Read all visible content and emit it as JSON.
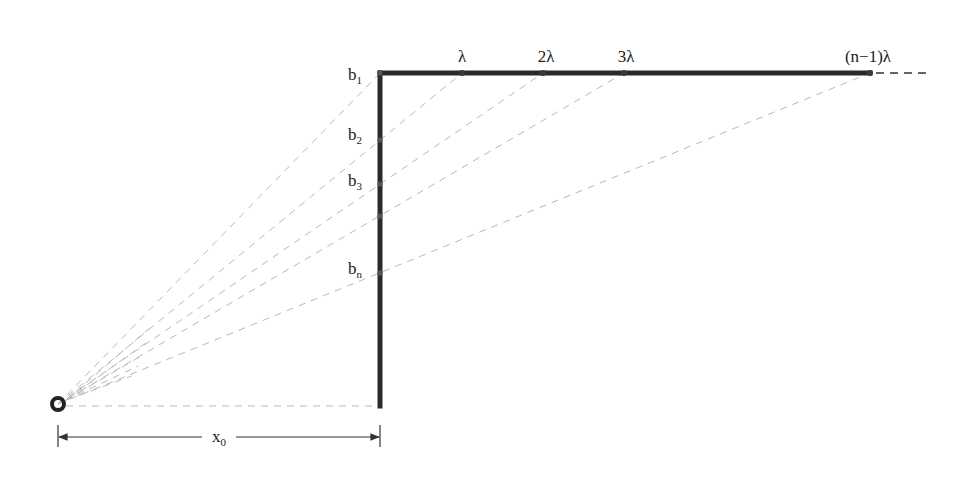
{
  "diagram": {
    "type": "geometric-construction",
    "colors": {
      "bar": "#2a2a2a",
      "ray": "#b8b8b8",
      "text": "#222222",
      "background": "#ffffff"
    },
    "source": {
      "name": "source-point",
      "x": 58,
      "y": 404,
      "r": 6
    },
    "corner": {
      "x": 380,
      "y": 73
    },
    "vertical_bar": {
      "x": 380,
      "y_top": 73,
      "y_bottom": 406
    },
    "horizontal_bar": {
      "y": 73,
      "x_start": 380,
      "x_end": 870,
      "dashed_extension_end": 926
    },
    "top_labels": [
      {
        "id": "lambda1",
        "text": "λ",
        "marker_x": 462,
        "label_x": 462
      },
      {
        "id": "lambda2",
        "text": "2λ",
        "marker_x": 543,
        "label_x": 546
      },
      {
        "id": "lambda3",
        "text": "3λ",
        "marker_x": 624,
        "label_x": 626
      },
      {
        "id": "lambdan",
        "text": "(n−1)λ",
        "marker_x": 870,
        "label_x": 868
      }
    ],
    "side_labels": [
      {
        "id": "b1",
        "base": "b",
        "sub": "1",
        "marker_y": 73,
        "label_y": 80
      },
      {
        "id": "b2",
        "base": "b",
        "sub": "2",
        "marker_y": 140,
        "label_y": 140
      },
      {
        "id": "b3",
        "base": "b",
        "sub": "3",
        "marker_y": 184,
        "label_y": 186
      },
      {
        "id": "b_extra",
        "base": "",
        "sub": "",
        "marker_y": 216,
        "label_y": 0
      },
      {
        "id": "bn",
        "base": "b",
        "sub": "n",
        "marker_y": 273,
        "label_y": 274
      }
    ],
    "baseline_ray": {
      "from_x": 58,
      "to_x": 376,
      "y": 406
    },
    "dimension": {
      "label_base": "x",
      "label_sub": "0",
      "y": 437,
      "x_left": 58,
      "x_right": 380,
      "label_x": 218
    },
    "extra_fan_rays": [
      0.3,
      0.55,
      0.8,
      1.05,
      1.25
    ]
  }
}
